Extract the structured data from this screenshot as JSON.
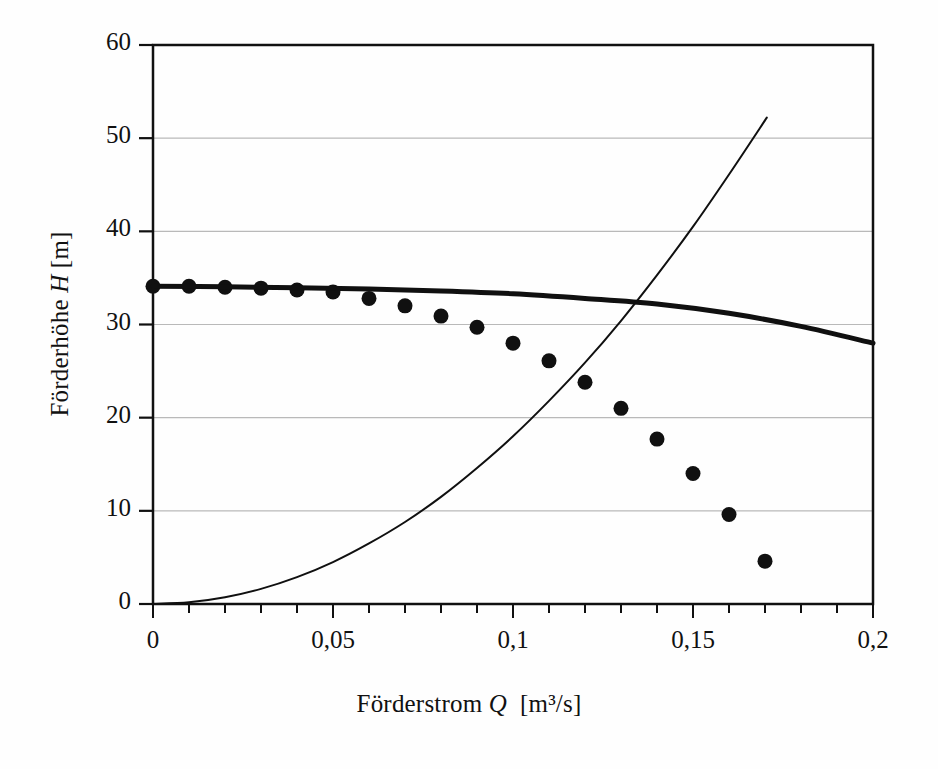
{
  "chart_data": {
    "type": "scatter",
    "title": "",
    "xlabel": "Förderstrom Q  [m³/s]",
    "xlabel_parts": {
      "name": "Förderstrom",
      "symbol": "Q",
      "unit": "[m³/s]"
    },
    "ylabel": "Förderhöhe H [m]",
    "ylabel_parts": {
      "name": "Förderhöhe",
      "symbol": "H",
      "unit": "[m]"
    },
    "xlim": [
      0,
      0.2
    ],
    "ylim": [
      0,
      60
    ],
    "x_major_ticks": [
      0,
      0.05,
      0.1,
      0.15,
      0.2
    ],
    "x_major_tick_labels": [
      "0",
      "0,05",
      "0,1",
      "0,15",
      "0,2"
    ],
    "x_minor_tick_step": 0.01,
    "y_major_ticks": [
      0,
      10,
      20,
      30,
      40,
      50,
      60
    ],
    "y_major_tick_labels": [
      "0",
      "10",
      "20",
      "30",
      "40",
      "50",
      "60"
    ],
    "grid": {
      "horizontal": true,
      "vertical": false,
      "color": "#b9b9b9"
    },
    "legend": null,
    "series": [
      {
        "name": "Messpunkte",
        "type": "scatter",
        "marker": "filled-circle",
        "color": "#101010",
        "points": [
          [
            0.0,
            34.1
          ],
          [
            0.01,
            34.1
          ],
          [
            0.02,
            34.0
          ],
          [
            0.03,
            33.9
          ],
          [
            0.04,
            33.7
          ],
          [
            0.05,
            33.5
          ],
          [
            0.06,
            32.8
          ],
          [
            0.07,
            32.0
          ],
          [
            0.08,
            30.9
          ],
          [
            0.09,
            29.7
          ],
          [
            0.1,
            28.0
          ],
          [
            0.11,
            26.1
          ],
          [
            0.12,
            23.8
          ],
          [
            0.13,
            21.0
          ],
          [
            0.14,
            17.7
          ],
          [
            0.15,
            14.0
          ],
          [
            0.16,
            9.6
          ],
          [
            0.17,
            4.6
          ]
        ]
      },
      {
        "name": "Pumpenkennlinie",
        "type": "line",
        "linewidth": 5,
        "color": "#101010",
        "points": [
          [
            0.0,
            34.1
          ],
          [
            0.02,
            34.05
          ],
          [
            0.04,
            33.95
          ],
          [
            0.06,
            33.8
          ],
          [
            0.08,
            33.6
          ],
          [
            0.1,
            33.3
          ],
          [
            0.12,
            32.8
          ],
          [
            0.14,
            32.2
          ],
          [
            0.16,
            31.2
          ],
          [
            0.18,
            29.8
          ],
          [
            0.2,
            28.0
          ]
        ]
      },
      {
        "name": "Anlagenkennlinie",
        "type": "line",
        "linewidth": 2,
        "color": "#101010",
        "points": [
          [
            0.0,
            0.0
          ],
          [
            0.01,
            0.18
          ],
          [
            0.02,
            0.72
          ],
          [
            0.03,
            1.62
          ],
          [
            0.04,
            2.88
          ],
          [
            0.05,
            4.5
          ],
          [
            0.06,
            6.5
          ],
          [
            0.07,
            8.8
          ],
          [
            0.08,
            11.5
          ],
          [
            0.09,
            14.6
          ],
          [
            0.1,
            18.0
          ],
          [
            0.11,
            21.8
          ],
          [
            0.12,
            25.9
          ],
          [
            0.13,
            30.4
          ],
          [
            0.14,
            35.3
          ],
          [
            0.15,
            40.5
          ],
          [
            0.16,
            46.1
          ],
          [
            0.1705,
            52.2
          ]
        ]
      }
    ],
    "annotations": {
      "operating_point": {
        "x": 0.134,
        "y": 32.3,
        "label": ""
      }
    }
  }
}
